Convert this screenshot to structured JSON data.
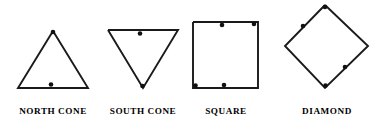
{
  "figure": {
    "background_color": "#ffffff",
    "stroke_color": "#1a1a1a",
    "dot_color": "#111111",
    "caption_color": "#000000",
    "shapes": [
      {
        "id": "north-cone",
        "label": "NORTH  CONE",
        "kind": "triangle-up",
        "outline_points": "53,31 88,88 18,88 53,31",
        "dots": [
          {
            "cx": 53,
            "cy": 32,
            "r": 2.3
          },
          {
            "cx": 51,
            "cy": 84.5,
            "r": 2.3
          }
        ],
        "caption_x": 53,
        "caption_y": 114
      },
      {
        "id": "south-cone",
        "label": "SOUTH  CONE",
        "kind": "triangle-down",
        "outline_points": "108,30 178,30 143,88 108,30",
        "dots": [
          {
            "cx": 140,
            "cy": 33.5,
            "r": 2.3
          },
          {
            "cx": 142.5,
            "cy": 86,
            "r": 2.3
          }
        ],
        "caption_x": 143,
        "caption_y": 114
      },
      {
        "id": "square",
        "label": "SQUARE",
        "kind": "square",
        "outline_points": "193,22 258,22 258,88 193,88 193,22",
        "dots": [
          {
            "cx": 222,
            "cy": 25,
            "r": 2.3
          },
          {
            "cx": 254,
            "cy": 24,
            "r": 2.3
          },
          {
            "cx": 195.5,
            "cy": 85.5,
            "r": 2.3
          },
          {
            "cx": 224,
            "cy": 85,
            "r": 2.3
          }
        ],
        "caption_x": 226,
        "caption_y": 114
      },
      {
        "id": "diamond",
        "label": "DIAMOND",
        "kind": "diamond",
        "outline_points": "325,5 368,46 325,88 285,46 325,5",
        "dots": [
          {
            "cx": 325,
            "cy": 7,
            "r": 2.3
          },
          {
            "cx": 303,
            "cy": 26,
            "r": 2.3
          },
          {
            "cx": 345,
            "cy": 67,
            "r": 2.3
          },
          {
            "cx": 325.5,
            "cy": 85.5,
            "r": 2.3
          }
        ],
        "caption_x": 327,
        "caption_y": 114
      }
    ]
  }
}
